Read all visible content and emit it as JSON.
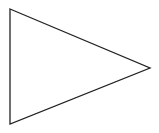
{
  "diagram": {
    "shape": "triangle",
    "orientation": "pointing-right",
    "stroke_color": "#222222",
    "fill_color": "#ffffff",
    "background_color": "#ffffff"
  }
}
